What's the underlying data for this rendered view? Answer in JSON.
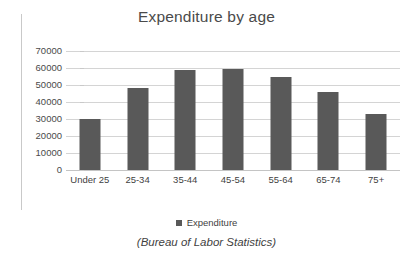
{
  "chart_data": {
    "type": "bar",
    "title": "Expenditure by age",
    "xlabel": "",
    "ylabel": "",
    "categories": [
      "Under 25",
      "25-34",
      "35-44",
      "45-54",
      "55-64",
      "65-74",
      "75+"
    ],
    "values": [
      30000,
      48000,
      58800,
      59400,
      54700,
      45900,
      33000
    ],
    "series": [
      {
        "name": "Expenditure",
        "values": [
          30000,
          48000,
          58800,
          59400,
          54700,
          45900,
          33000
        ]
      }
    ],
    "ylim": [
      0,
      70000
    ],
    "ytick_labels": [
      "70000",
      "60000",
      "50000",
      "40000",
      "30000",
      "20000",
      "10000",
      "0"
    ],
    "ytick_values": [
      70000,
      60000,
      50000,
      40000,
      30000,
      20000,
      10000,
      0
    ],
    "ytick_step": 10000,
    "grid": true,
    "legend": [
      "Expenditure"
    ],
    "legend_position": "bottom",
    "caption": "(Bureau of Labor Statistics)",
    "colors": {
      "bar": "#595959",
      "gridline": "#d4d4d4",
      "axis": "#c9c9c9",
      "text": "#3f3f3f",
      "title_text": "#4a4a4a",
      "background": "#ffffff"
    }
  }
}
